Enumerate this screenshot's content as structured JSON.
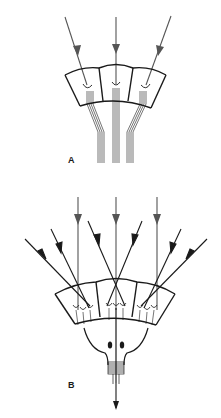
{
  "figure": {
    "colors": {
      "background": "#ffffff",
      "stroke": "#1a1a1a",
      "arrow_gray": "#555555"
    }
  },
  "panels": [
    {
      "label": "A",
      "cells": 3,
      "incoming_arrows": 3,
      "fiber_bundles": 3
    },
    {
      "label": "B",
      "cells": 3,
      "incoming_arrows": 9,
      "output_arrows": 1
    }
  ]
}
